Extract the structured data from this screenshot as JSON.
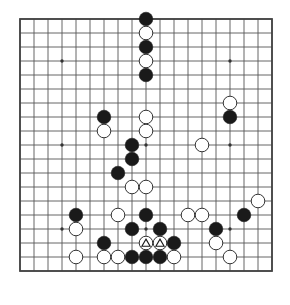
{
  "diagram": {
    "title": "Go board position",
    "kind": "go-board-diagram",
    "board_size": 19,
    "colors": {
      "background": "#ffffff",
      "grid_line": "#555555",
      "border_line": "#444444",
      "black_stone": "#1a1a1a",
      "white_stone": "#ffffff",
      "white_stone_outline": "#333333",
      "star_point": "#333333",
      "mark_triangle": "#1a1a1a"
    },
    "geometry": {
      "origin_x": 20,
      "origin_y": 19,
      "spacing": 14,
      "stone_radius": 6.8,
      "star_radius": 1.7,
      "line_width": 0.9,
      "border_width": 1.8
    },
    "star_points": [
      {
        "col": 3,
        "row": 3
      },
      {
        "col": 9,
        "row": 3
      },
      {
        "col": 15,
        "row": 3
      },
      {
        "col": 3,
        "row": 9
      },
      {
        "col": 9,
        "row": 9
      },
      {
        "col": 15,
        "row": 9
      },
      {
        "col": 3,
        "row": 15
      },
      {
        "col": 9,
        "row": 15
      },
      {
        "col": 15,
        "row": 15
      }
    ],
    "legend": {
      "black_name": "black-stone",
      "white_name": "white-stone",
      "marked_name": "white-stone-triangle-marked"
    },
    "counts": {
      "black": 24,
      "white": 22,
      "marked": 2
    },
    "stones": [
      {
        "col": 9,
        "row": 0,
        "color": "black",
        "mark": "none",
        "name": "black-stone"
      },
      {
        "col": 9,
        "row": 1,
        "color": "white",
        "mark": "none",
        "name": "white-stone"
      },
      {
        "col": 9,
        "row": 2,
        "color": "black",
        "mark": "none",
        "name": "black-stone"
      },
      {
        "col": 9,
        "row": 3,
        "color": "white",
        "mark": "none",
        "name": "white-stone"
      },
      {
        "col": 9,
        "row": 4,
        "color": "black",
        "mark": "none",
        "name": "black-stone"
      },
      {
        "col": 15,
        "row": 6,
        "color": "white",
        "mark": "none",
        "name": "white-stone"
      },
      {
        "col": 6,
        "row": 7,
        "color": "black",
        "mark": "none",
        "name": "black-stone"
      },
      {
        "col": 9,
        "row": 7,
        "color": "white",
        "mark": "none",
        "name": "white-stone"
      },
      {
        "col": 15,
        "row": 7,
        "color": "black",
        "mark": "none",
        "name": "black-stone"
      },
      {
        "col": 6,
        "row": 8,
        "color": "white",
        "mark": "none",
        "name": "white-stone"
      },
      {
        "col": 9,
        "row": 8,
        "color": "white",
        "mark": "none",
        "name": "white-stone"
      },
      {
        "col": 8,
        "row": 9,
        "color": "black",
        "mark": "none",
        "name": "black-stone"
      },
      {
        "col": 13,
        "row": 9,
        "color": "white",
        "mark": "none",
        "name": "white-stone"
      },
      {
        "col": 8,
        "row": 10,
        "color": "black",
        "mark": "none",
        "name": "black-stone"
      },
      {
        "col": 7,
        "row": 11,
        "color": "black",
        "mark": "none",
        "name": "black-stone"
      },
      {
        "col": 8,
        "row": 12,
        "color": "white",
        "mark": "none",
        "name": "white-stone"
      },
      {
        "col": 9,
        "row": 12,
        "color": "white",
        "mark": "none",
        "name": "white-stone"
      },
      {
        "col": 17,
        "row": 13,
        "color": "white",
        "mark": "none",
        "name": "white-stone"
      },
      {
        "col": 4,
        "row": 14,
        "color": "black",
        "mark": "none",
        "name": "black-stone"
      },
      {
        "col": 7,
        "row": 14,
        "color": "white",
        "mark": "none",
        "name": "white-stone"
      },
      {
        "col": 9,
        "row": 14,
        "color": "black",
        "mark": "none",
        "name": "black-stone"
      },
      {
        "col": 12,
        "row": 14,
        "color": "white",
        "mark": "none",
        "name": "white-stone"
      },
      {
        "col": 13,
        "row": 14,
        "color": "white",
        "mark": "none",
        "name": "white-stone"
      },
      {
        "col": 16,
        "row": 14,
        "color": "black",
        "mark": "none",
        "name": "black-stone"
      },
      {
        "col": 4,
        "row": 15,
        "color": "white",
        "mark": "none",
        "name": "white-stone"
      },
      {
        "col": 8,
        "row": 15,
        "color": "black",
        "mark": "none",
        "name": "black-stone"
      },
      {
        "col": 10,
        "row": 15,
        "color": "black",
        "mark": "none",
        "name": "black-stone"
      },
      {
        "col": 14,
        "row": 15,
        "color": "black",
        "mark": "none",
        "name": "black-stone"
      },
      {
        "col": 6,
        "row": 16,
        "color": "black",
        "mark": "none",
        "name": "black-stone"
      },
      {
        "col": 9,
        "row": 16,
        "color": "white",
        "mark": "triangle",
        "name": "white-stone-triangle-marked"
      },
      {
        "col": 10,
        "row": 16,
        "color": "white",
        "mark": "triangle",
        "name": "white-stone-triangle-marked"
      },
      {
        "col": 11,
        "row": 16,
        "color": "black",
        "mark": "none",
        "name": "black-stone"
      },
      {
        "col": 14,
        "row": 16,
        "color": "white",
        "mark": "none",
        "name": "white-stone"
      },
      {
        "col": 4,
        "row": 17,
        "color": "white",
        "mark": "none",
        "name": "white-stone"
      },
      {
        "col": 6,
        "row": 17,
        "color": "white",
        "mark": "none",
        "name": "white-stone"
      },
      {
        "col": 7,
        "row": 17,
        "color": "white",
        "mark": "none",
        "name": "white-stone"
      },
      {
        "col": 8,
        "row": 17,
        "color": "black",
        "mark": "none",
        "name": "black-stone"
      },
      {
        "col": 9,
        "row": 17,
        "color": "black",
        "mark": "none",
        "name": "black-stone"
      },
      {
        "col": 10,
        "row": 17,
        "color": "black",
        "mark": "none",
        "name": "black-stone"
      },
      {
        "col": 11,
        "row": 17,
        "color": "white",
        "mark": "none",
        "name": "white-stone"
      },
      {
        "col": 15,
        "row": 17,
        "color": "white",
        "mark": "none",
        "name": "white-stone"
      }
    ]
  }
}
